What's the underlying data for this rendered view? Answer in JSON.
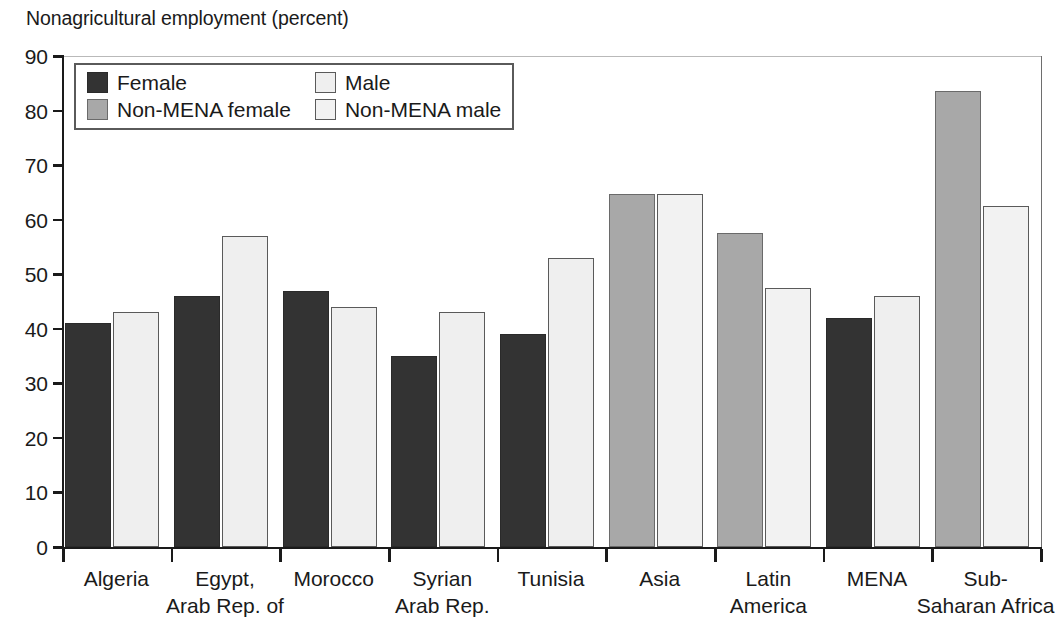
{
  "chart_data": {
    "type": "bar",
    "title": "Nonagricultural employment (percent)",
    "xlabel": "",
    "ylabel": "",
    "ylim": [
      0,
      90
    ],
    "yticks": [
      0,
      10,
      20,
      30,
      40,
      50,
      60,
      70,
      80,
      90
    ],
    "grid": false,
    "legend_position": "top-left inside plot",
    "categories": [
      "Algeria",
      "Egypt, Arab Rep. of",
      "Morocco",
      "Syrian Arab Rep.",
      "Tunisia",
      "Asia",
      "Latin America",
      "MENA",
      "Sub-Saharan Africa"
    ],
    "category_label_lines": [
      [
        "Algeria",
        ""
      ],
      [
        "Egypt,",
        "Arab Rep. of"
      ],
      [
        "Morocco",
        ""
      ],
      [
        "Syrian",
        "Arab Rep."
      ],
      [
        "Tunisia",
        ""
      ],
      [
        "Asia",
        ""
      ],
      [
        "Latin",
        "America"
      ],
      [
        "MENA",
        ""
      ],
      [
        "Sub-",
        "Saharan Africa"
      ]
    ],
    "series": [
      {
        "name": "Female",
        "key": "female",
        "color": "#333333",
        "values": [
          41,
          46,
          47,
          35,
          39,
          null,
          null,
          42,
          null
        ]
      },
      {
        "name": "Male",
        "key": "male",
        "color": "#efefef",
        "values": [
          43,
          57,
          44,
          43,
          53,
          null,
          null,
          46,
          null
        ]
      },
      {
        "name": "Non-MENA female",
        "key": "nm-female",
        "color": "#a8a8a8",
        "values": [
          null,
          null,
          null,
          null,
          null,
          64.7,
          57.5,
          null,
          83.5
        ]
      },
      {
        "name": "Non-MENA male",
        "key": "nm-male",
        "color": "#f2f2f2",
        "values": [
          null,
          null,
          null,
          null,
          null,
          64.7,
          47.5,
          null,
          62.5
        ]
      }
    ]
  },
  "legend": {
    "items": [
      {
        "label": "Female",
        "key": "female"
      },
      {
        "label": "Male",
        "key": "male"
      },
      {
        "label": "Non-MENA female",
        "key": "nm-female"
      },
      {
        "label": "Non-MENA male",
        "key": "nm-male"
      }
    ]
  }
}
